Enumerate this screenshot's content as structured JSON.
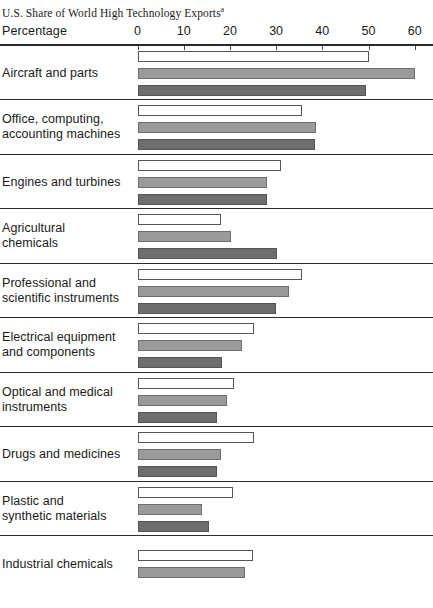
{
  "title": {
    "text": "U.S. Share of World High Technology Exports",
    "footnote_marker": "a"
  },
  "axis": {
    "label": "Percentage",
    "ticks": [
      {
        "value": 0,
        "label": "0"
      },
      {
        "value": 10,
        "label": "10"
      },
      {
        "value": 20,
        "label": "20"
      },
      {
        "value": 30,
        "label": "30"
      },
      {
        "value": 40,
        "label": "40"
      },
      {
        "value": 50,
        "label": "50"
      },
      {
        "value": 60,
        "label": "60"
      }
    ]
  },
  "colors": {
    "series_0": "#ffffff",
    "series_1": "#9a9a9a",
    "series_2": "#6e6e6e",
    "rule": "#2a2a2a",
    "text": "#1a1a1a"
  },
  "chart_data": {
    "type": "bar",
    "orientation": "horizontal",
    "title": "U.S. Share of World High Technology Exports",
    "xlabel": "Percentage",
    "ylabel": "",
    "xlim": [
      0,
      62
    ],
    "grid": false,
    "legend": "none",
    "categories": [
      "Aircraft and parts",
      "Office, computing, accounting machines",
      "Engines and turbines",
      "Agricultural chemicals",
      "Professional and scientific instruments",
      "Electrical equipment and components",
      "Optical and medical instruments",
      "Drugs and medicines",
      "Plastic and synthetic materials",
      "Industrial chemicals"
    ],
    "series": [
      {
        "name": "series-1",
        "fill": "white",
        "values": [
          50.0,
          35.7,
          31.0,
          18.0,
          35.5,
          25.3,
          20.8,
          25.3,
          20.6,
          25.0
        ]
      },
      {
        "name": "series-2",
        "fill": "light-gray",
        "values": [
          60.0,
          38.7,
          28.0,
          20.3,
          32.7,
          22.7,
          19.3,
          18.0,
          14.0,
          23.2
        ]
      },
      {
        "name": "series-3",
        "fill": "dark-gray",
        "values": [
          49.4,
          38.5,
          28.0,
          30.3,
          30.0,
          18.2,
          17.3,
          17.3,
          15.4,
          null
        ]
      }
    ]
  },
  "rows": [
    {
      "label_lines": [
        "Aircraft and parts"
      ],
      "values": [
        50.0,
        60.0,
        49.4
      ]
    },
    {
      "label_lines": [
        "Office, computing,",
        "accounting machines"
      ],
      "values": [
        35.7,
        38.7,
        38.5
      ]
    },
    {
      "label_lines": [
        "Engines and turbines"
      ],
      "values": [
        31.0,
        28.0,
        28.0
      ]
    },
    {
      "label_lines": [
        "Agricultural",
        "chemicals"
      ],
      "values": [
        18.0,
        20.3,
        30.3
      ]
    },
    {
      "label_lines": [
        "Professional and",
        "scientific instruments"
      ],
      "values": [
        35.5,
        32.7,
        30.0
      ]
    },
    {
      "label_lines": [
        "Electrical equipment",
        "and components"
      ],
      "values": [
        25.3,
        22.7,
        18.2
      ]
    },
    {
      "label_lines": [
        "Optical and medical",
        "instruments"
      ],
      "values": [
        20.8,
        19.3,
        17.3
      ]
    },
    {
      "label_lines": [
        "Drugs and medicines"
      ],
      "values": [
        25.3,
        18.0,
        17.3
      ]
    },
    {
      "label_lines": [
        "Plastic and",
        "synthetic materials"
      ],
      "values": [
        20.6,
        14.0,
        15.4
      ]
    },
    {
      "label_lines": [
        "Industrial chemicals"
      ],
      "values": [
        25.0,
        23.2
      ]
    }
  ]
}
